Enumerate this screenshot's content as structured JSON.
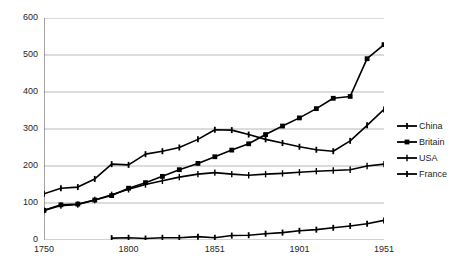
{
  "chart_data": {
    "type": "line",
    "title": "",
    "xlabel": "",
    "ylabel": "",
    "xlim": [
      1750,
      1951
    ],
    "ylim": [
      0,
      600
    ],
    "yticks": [
      0,
      100,
      200,
      300,
      400,
      500,
      600
    ],
    "xticks": [
      1750,
      1800,
      1851,
      1901,
      1951
    ],
    "grid": "horizontal",
    "legend_position": "right",
    "series": [
      {
        "name": "China",
        "marker": "cross-plus",
        "color": "#000000",
        "x": [
          1750,
          1760,
          1770,
          1780,
          1790,
          1800,
          1810,
          1820,
          1830,
          1841,
          1851,
          1861,
          1871,
          1881,
          1891,
          1901,
          1911,
          1921,
          1931,
          1941,
          1951
        ],
        "values": [
          125,
          140,
          143,
          165,
          205,
          203,
          232,
          240,
          250,
          272,
          298,
          297,
          285,
          272,
          262,
          252,
          244,
          240,
          268,
          310,
          353
        ]
      },
      {
        "name": "Britain",
        "marker": "square",
        "color": "#000000",
        "x": [
          1750,
          1760,
          1770,
          1780,
          1790,
          1800,
          1810,
          1820,
          1830,
          1841,
          1851,
          1861,
          1871,
          1881,
          1891,
          1901,
          1911,
          1921,
          1931,
          1941,
          1951
        ],
        "values": [
          80,
          95,
          97,
          108,
          120,
          140,
          155,
          172,
          190,
          207,
          225,
          243,
          260,
          285,
          308,
          330,
          355,
          383,
          388,
          490,
          528
        ]
      },
      {
        "name": "USA",
        "marker": "cross-thin",
        "color": "#000000",
        "x": [
          1750,
          1760,
          1770,
          1780,
          1790,
          1800,
          1810,
          1820,
          1830,
          1841,
          1851,
          1861,
          1871,
          1881,
          1891,
          1901,
          1911,
          1921,
          1931,
          1941,
          1951
        ],
        "values": [
          80,
          93,
          96,
          108,
          122,
          137,
          150,
          160,
          170,
          178,
          182,
          178,
          175,
          178,
          180,
          183,
          186,
          188,
          190,
          200,
          205
        ]
      },
      {
        "name": "France",
        "marker": "cross-plus",
        "color": "#000000",
        "x": [
          1790,
          1800,
          1810,
          1820,
          1830,
          1841,
          1851,
          1861,
          1871,
          1881,
          1891,
          1901,
          1911,
          1921,
          1931,
          1941,
          1951
        ],
        "values": [
          5,
          6,
          4,
          6,
          6,
          9,
          6,
          12,
          13,
          17,
          20,
          25,
          28,
          33,
          38,
          44,
          53
        ]
      }
    ],
    "legend": [
      "China",
      "Britain",
      "USA",
      "France"
    ]
  }
}
